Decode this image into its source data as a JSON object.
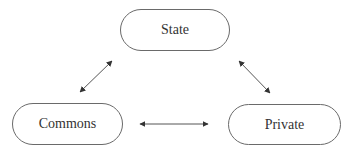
{
  "diagram": {
    "type": "triangle-relationship",
    "nodes": [
      {
        "id": "state",
        "label": "State",
        "x": 120,
        "y": 9,
        "w": 110,
        "h": 42
      },
      {
        "id": "commons",
        "label": "Commons",
        "x": 12,
        "y": 103,
        "w": 111,
        "h": 42
      },
      {
        "id": "private",
        "label": "Private",
        "x": 228,
        "y": 104,
        "w": 113,
        "h": 41
      }
    ],
    "edges": [
      {
        "from": "commons",
        "to": "state",
        "direction": "bidirectional"
      },
      {
        "from": "state",
        "to": "private",
        "direction": "bidirectional"
      },
      {
        "from": "commons",
        "to": "private",
        "direction": "bidirectional"
      }
    ],
    "colors": {
      "stroke": "#6a6a6a",
      "arrow": "#444444",
      "text": "#333333",
      "background": "#ffffff"
    }
  }
}
